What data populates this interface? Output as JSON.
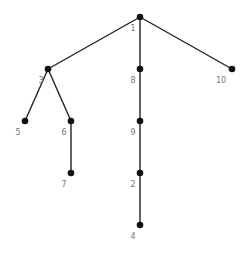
{
  "diagram": {
    "type": "tree",
    "colors": {
      "edge": "#222222",
      "node": "#111111",
      "label": "#777777",
      "background": "#ffffff"
    },
    "nodes": [
      {
        "id": "1",
        "label": "1",
        "x": 140,
        "y": 17
      },
      {
        "id": "3",
        "label": "3",
        "x": 48,
        "y": 69
      },
      {
        "id": "8",
        "label": "8",
        "x": 140,
        "y": 69
      },
      {
        "id": "10",
        "label": "10",
        "x": 232,
        "y": 69
      },
      {
        "id": "5",
        "label": "5",
        "x": 25,
        "y": 121
      },
      {
        "id": "6",
        "label": "6",
        "x": 71,
        "y": 121
      },
      {
        "id": "9",
        "label": "9",
        "x": 140,
        "y": 121
      },
      {
        "id": "7",
        "label": "7",
        "x": 71,
        "y": 173
      },
      {
        "id": "2",
        "label": "2",
        "x": 140,
        "y": 173
      },
      {
        "id": "4",
        "label": "4",
        "x": 140,
        "y": 225
      }
    ],
    "edges": [
      {
        "from": "1",
        "to": "3"
      },
      {
        "from": "1",
        "to": "8"
      },
      {
        "from": "1",
        "to": "10"
      },
      {
        "from": "3",
        "to": "5"
      },
      {
        "from": "3",
        "to": "6"
      },
      {
        "from": "6",
        "to": "7"
      },
      {
        "from": "8",
        "to": "9"
      },
      {
        "from": "9",
        "to": "2"
      },
      {
        "from": "2",
        "to": "4"
      }
    ]
  }
}
